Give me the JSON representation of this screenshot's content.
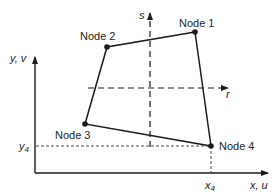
{
  "diagram": {
    "nodes": [
      {
        "label": "Node 1",
        "x": 195,
        "y": 32
      },
      {
        "label": "Node 2",
        "x": 107,
        "y": 47
      },
      {
        "label": "Node 3",
        "x": 85,
        "y": 124
      },
      {
        "label": "Node 4",
        "x": 211,
        "y": 146
      }
    ],
    "global_axes": {
      "x_label": "x, u",
      "y_label": "y, v"
    },
    "natural_axes": {
      "r_label": "r",
      "s_label": "s"
    },
    "coordinate_labels": {
      "x4": "x",
      "x4_sub": "4",
      "y4": "y",
      "y4_sub": "4"
    },
    "colors": {
      "line": "#1a1a1a",
      "background": "#ffffff"
    }
  }
}
